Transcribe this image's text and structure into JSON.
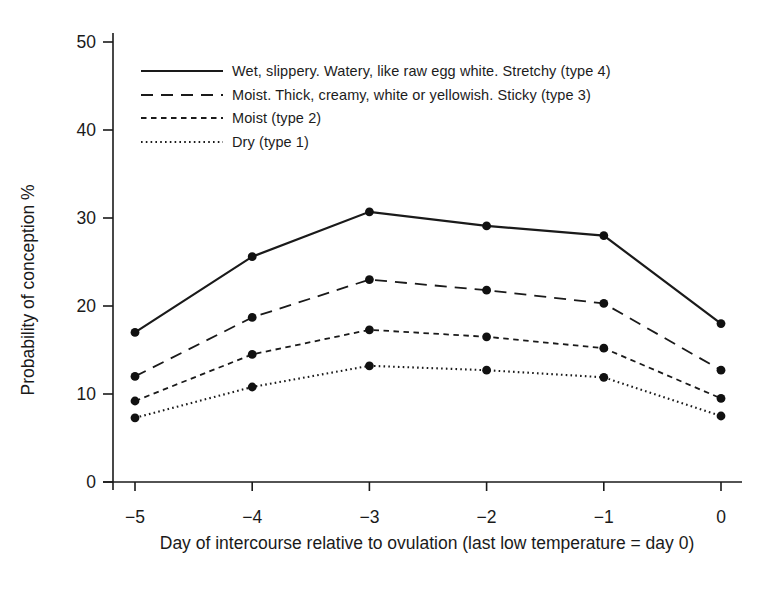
{
  "figure": {
    "background": "#ffffff",
    "ink_color": "#1a1a1a"
  },
  "chart_data": {
    "type": "line",
    "title": "",
    "xlabel": "Day of intercourse relative to ovulation (last low temperature = day 0)",
    "ylabel": "Probability of conception %",
    "x": [
      -5,
      -4,
      -3,
      -2,
      -1,
      0
    ],
    "xtick_labels": [
      "−5",
      "−4",
      "−3",
      "−2",
      "−1",
      "0"
    ],
    "yticks": [
      0,
      10,
      20,
      30,
      40,
      50
    ],
    "ylim": [
      0,
      50
    ],
    "xlim": [
      -5,
      0
    ],
    "grid": false,
    "marker": "filled-circle",
    "legend_position": "upper-left-inside",
    "series": [
      {
        "name": "Wet, slippery.  Watery, like raw egg white. Stretchy (type 4)",
        "style": "solid",
        "values": [
          17.0,
          25.6,
          30.7,
          29.1,
          28.0,
          18.0
        ]
      },
      {
        "name": "Moist.  Thick, creamy, white or yellowish. Sticky (type 3)",
        "style": "long-dash",
        "values": [
          12.0,
          18.7,
          23.0,
          21.8,
          20.3,
          12.7
        ]
      },
      {
        "name": "Moist (type 2)",
        "style": "short-dash",
        "values": [
          9.2,
          14.5,
          17.3,
          16.5,
          15.2,
          9.5
        ]
      },
      {
        "name": "Dry (type 1)",
        "style": "dotted",
        "values": [
          7.3,
          10.8,
          13.2,
          12.7,
          11.9,
          7.5
        ]
      }
    ]
  }
}
